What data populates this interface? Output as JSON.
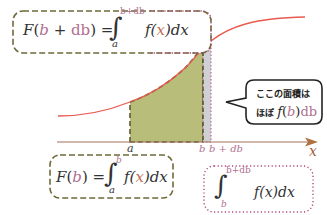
{
  "colors": {
    "curve": "#e85a4f",
    "axis": "#a0705a",
    "area_fill": "#b9bd7a",
    "area_border": "#5c5a2e",
    "strip_fill": "#c8c8d0",
    "strip_border": "#c46a8a",
    "box1_border": "#6e6a3a",
    "box3_border": "#b0487a",
    "var_color": "#b07090",
    "x_color": "#c07050"
  },
  "formula_top": {
    "lhs_F": "F",
    "lhs_open": "(",
    "lhs_b": "b",
    "lhs_plus": " + ",
    "lhs_db": "db",
    "lhs_close": ")",
    "eq": " = ",
    "integral": "∫",
    "upper": "b+db",
    "lower": "a",
    "integrand_f": "f(",
    "integrand_x": "x",
    "integrand_close": ")d",
    "integrand_dx": "x"
  },
  "formula_bottom": {
    "lhs_F": "F",
    "lhs_open": "(",
    "lhs_b": "b",
    "lhs_close": ")",
    "eq": " = ",
    "integral": "∫",
    "upper": "b",
    "lower": "a",
    "integrand_f": "f(",
    "integrand_x": "x",
    "integrand_close": ")d",
    "integrand_dx": "x"
  },
  "formula_strip": {
    "integral": "∫",
    "upper": "b+db",
    "lower": "b",
    "integrand": "f(x)dx"
  },
  "callout": {
    "line1": "ここの面積は",
    "line2_prefix": "ほぼ",
    "line2_f": "f",
    "line2_open": "(",
    "line2_b": "b",
    "line2_close": ")",
    "line2_db": "db"
  },
  "axis_labels": {
    "a": "a",
    "b": "b",
    "b_plus_db": "b + db",
    "x": "x"
  }
}
